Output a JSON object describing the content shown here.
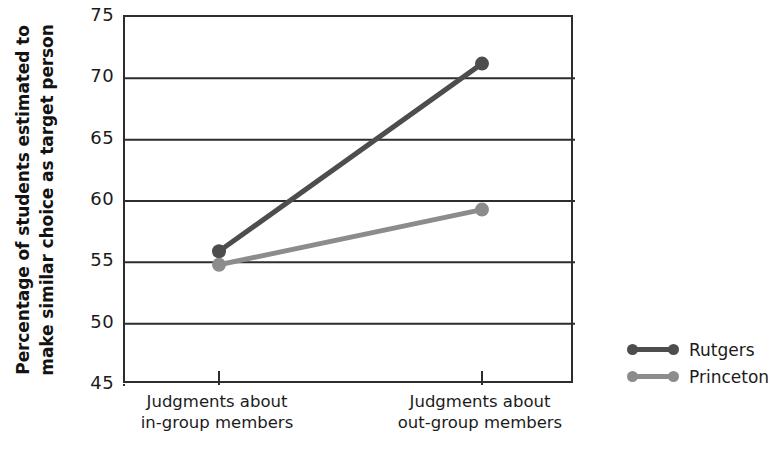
{
  "chart_data": {
    "type": "line",
    "title": "",
    "xlabel": "",
    "ylabel": "Percentage of students estimated to make similar choice as target person",
    "ylabel_line1": "Percentage of students estimated to",
    "ylabel_line2": "make similar choice as target person",
    "categories": [
      "Judgments about\nin-group members",
      "Judgments about\nout-group members"
    ],
    "ylim": [
      45,
      75
    ],
    "yticks": [
      75,
      70,
      65,
      60,
      55,
      50,
      45
    ],
    "ytick_labels": [
      "75",
      "70",
      "65",
      "60",
      "55",
      "50",
      "45"
    ],
    "grid": true,
    "legend_position": "right",
    "series": [
      {
        "name": "Rutgers",
        "color": "#4d4d4d",
        "values": [
          55.9,
          71.2
        ]
      },
      {
        "name": "Princeton",
        "color": "#8c8c8c",
        "values": [
          54.8,
          59.3
        ]
      }
    ]
  },
  "legend": {
    "items": [
      {
        "label": "Rutgers",
        "color": "#4d4d4d"
      },
      {
        "label": "Princeton",
        "color": "#8c8c8c"
      }
    ]
  },
  "axes": {
    "y_tick_0": "75",
    "y_tick_1": "70",
    "y_tick_2": "65",
    "y_tick_3": "60",
    "y_tick_4": "55",
    "y_tick_5": "50",
    "y_tick_6": "45",
    "x_tick_0": "Judgments about\nin-group members",
    "x_tick_1": "Judgments about\nout-group members"
  },
  "colors": {
    "axis": "#2d2d2d",
    "grid": "#2d2d2d",
    "series_dark": "#4d4d4d",
    "series_light": "#8c8c8c",
    "text": "#1b1b1b",
    "background": "#ffffff"
  }
}
